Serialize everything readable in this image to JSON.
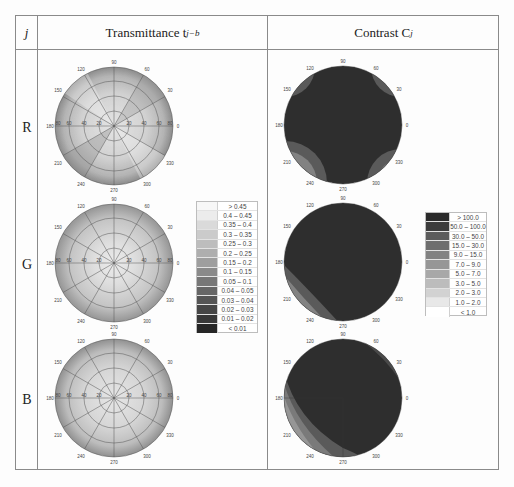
{
  "table": {
    "header": {
      "col_j": "j",
      "col_transmittance": "Transmittance t",
      "col_transmittance_sub": "j−b",
      "col_contrast": "Contrast C",
      "col_contrast_sub": "j"
    },
    "rows": [
      {
        "label": "R"
      },
      {
        "label": "G"
      },
      {
        "label": "B"
      }
    ]
  },
  "polar_axis": {
    "angle_ticks": [
      "0",
      "30",
      "60",
      "90",
      "120",
      "150",
      "180",
      "210",
      "240",
      "270",
      "300",
      "330"
    ],
    "radial_ticks": [
      "20",
      "40",
      "60",
      "80"
    ]
  },
  "transmittance_legend": {
    "items": [
      {
        "label": "> 0.45",
        "color": "#f7f7f7"
      },
      {
        "label": "0.4 – 0.45",
        "color": "#ececec"
      },
      {
        "label": "0.35 – 0.4",
        "color": "#dadada"
      },
      {
        "label": "0.3 – 0.35",
        "color": "#cbcbcb"
      },
      {
        "label": "0.25 – 0.3",
        "color": "#bdbdbd"
      },
      {
        "label": "0.2 – 0.25",
        "color": "#aeaeae"
      },
      {
        "label": "0.15 – 0.2",
        "color": "#9e9e9e"
      },
      {
        "label": "0.1 – 0.15",
        "color": "#8a8a8a"
      },
      {
        "label": "0.05 – 0.1",
        "color": "#777777"
      },
      {
        "label": "0.04 – 0.05",
        "color": "#666666"
      },
      {
        "label": "0.03 – 0.04",
        "color": "#555555"
      },
      {
        "label": "0.02 – 0.03",
        "color": "#464646"
      },
      {
        "label": "0.01 – 0.02",
        "color": "#383838"
      },
      {
        "label": "< 0.01",
        "color": "#262626"
      }
    ]
  },
  "contrast_legend": {
    "items": [
      {
        "label": "> 100.0",
        "color": "#2a2a2a"
      },
      {
        "label": "50.0 – 100.0",
        "color": "#3c3c3c"
      },
      {
        "label": "30.0 – 50.0",
        "color": "#5c5c5c"
      },
      {
        "label": "15.0 – 30.0",
        "color": "#6e6e6e"
      },
      {
        "label": "9.0 – 15.0",
        "color": "#828282"
      },
      {
        "label": "7.0 – 9.0",
        "color": "#969696"
      },
      {
        "label": "5.0 – 7.0",
        "color": "#a8a8a8"
      },
      {
        "label": "3.0 – 5.0",
        "color": "#bcbcbc"
      },
      {
        "label": "2.0 – 3.0",
        "color": "#d2d2d2"
      },
      {
        "label": "1.0 – 2.0",
        "color": "#e8e8e8"
      },
      {
        "label": "< 1.0",
        "color": "#ffffff"
      }
    ]
  }
}
